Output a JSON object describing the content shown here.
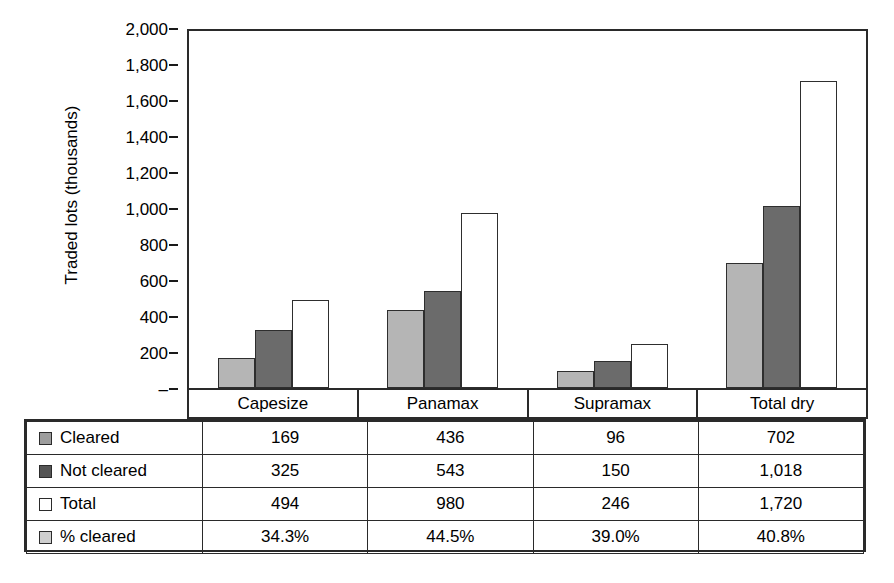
{
  "chart_data": {
    "type": "bar",
    "title": "",
    "xlabel": "",
    "ylabel": "Traded lots (thousands)",
    "ylim": [
      0,
      2000
    ],
    "grid": false,
    "legend_position": "table-below",
    "categories": [
      "Capesize",
      "Panamax",
      "Supramax",
      "Total dry"
    ],
    "y_ticks": [
      "–",
      "200",
      "400",
      "600",
      "800",
      "1,000",
      "1,200",
      "1,400",
      "1,600",
      "1,800",
      "2,000"
    ],
    "y_tick_values": [
      0,
      200,
      400,
      600,
      800,
      1000,
      1200,
      1400,
      1600,
      1800,
      2000
    ],
    "series": [
      {
        "name": "Cleared",
        "swatch": "cleared",
        "color": "#b5b5b5",
        "values": [
          169,
          436,
          96,
          702
        ],
        "labels": [
          "169",
          "436",
          "96",
          "702"
        ]
      },
      {
        "name": "Not cleared",
        "swatch": "notcleared",
        "color": "#6b6b6b",
        "values": [
          325,
          543,
          150,
          1018
        ],
        "labels": [
          "325",
          "543",
          "150",
          "1,018"
        ]
      },
      {
        "name": "Total",
        "swatch": "total",
        "color": "#ffffff",
        "values": [
          494,
          980,
          246,
          1720
        ],
        "labels": [
          "494",
          "980",
          "246",
          "1,720"
        ]
      },
      {
        "name": "% cleared",
        "swatch": "pct",
        "color": "#cfcfcf",
        "values": [
          34.3,
          44.5,
          39.0,
          40.8
        ],
        "labels": [
          "34.3%",
          "44.5%",
          "39.0%",
          "40.8%"
        ],
        "plotted": false
      }
    ]
  },
  "axis": {
    "y_title": "Traded lots (thousands)",
    "ticks": [
      {
        "label": "2,000",
        "value": 2000
      },
      {
        "label": "1,800",
        "value": 1800
      },
      {
        "label": "1,600",
        "value": 1600
      },
      {
        "label": "1,400",
        "value": 1400
      },
      {
        "label": "1,200",
        "value": 1200
      },
      {
        "label": "1,000",
        "value": 1000
      },
      {
        "label": "800",
        "value": 800
      },
      {
        "label": "600",
        "value": 600
      },
      {
        "label": "400",
        "value": 400
      },
      {
        "label": "200",
        "value": 200
      },
      {
        "label": "–",
        "value": 0
      }
    ]
  },
  "categories": [
    "Capesize",
    "Panamax",
    "Supramax",
    "Total dry"
  ],
  "table": {
    "rows": [
      {
        "label": "Cleared",
        "swatch": "cleared",
        "cells": [
          "169",
          "436",
          "96",
          "702"
        ]
      },
      {
        "label": "Not cleared",
        "swatch": "notcleared",
        "cells": [
          "325",
          "543",
          "150",
          "1,018"
        ]
      },
      {
        "label": "Total",
        "swatch": "total",
        "cells": [
          "494",
          "980",
          "246",
          "1,720"
        ]
      },
      {
        "label": "% cleared",
        "swatch": "pct",
        "cells": [
          "34.3%",
          "44.5%",
          "39.0%",
          "40.8%"
        ]
      }
    ]
  }
}
